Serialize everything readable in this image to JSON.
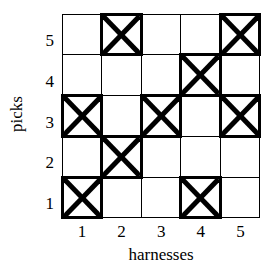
{
  "chart_data": {
    "type": "heatmap",
    "title": "",
    "xlabel": "harnesses",
    "ylabel": "picks",
    "x": [
      1,
      2,
      3,
      4,
      5
    ],
    "y": [
      1,
      2,
      3,
      4,
      5
    ],
    "xticklabels": [
      "1",
      "2",
      "3",
      "4",
      "5"
    ],
    "yticklabels": [
      "5",
      "4",
      "3",
      "2",
      "1"
    ],
    "grid": true,
    "legend": null,
    "marker": "x-box",
    "note": "Weave draft / threading grid. 1 = marked cell (filled with X and bold border), 0 = empty cell. Rows listed top to bottom: picks 5,4,3,2,1. Columns left to right: harnesses 1..5.",
    "rows": [
      {
        "pick": "5",
        "values": [
          0,
          1,
          0,
          0,
          1
        ]
      },
      {
        "pick": "4",
        "values": [
          0,
          0,
          0,
          1,
          0
        ]
      },
      {
        "pick": "3",
        "values": [
          1,
          0,
          1,
          0,
          1
        ]
      },
      {
        "pick": "2",
        "values": [
          0,
          1,
          0,
          0,
          0
        ]
      },
      {
        "pick": "1",
        "values": [
          1,
          0,
          0,
          1,
          0
        ]
      }
    ],
    "marked_cells": [
      {
        "harness": 2,
        "pick": 5
      },
      {
        "harness": 5,
        "pick": 5
      },
      {
        "harness": 4,
        "pick": 4
      },
      {
        "harness": 1,
        "pick": 3
      },
      {
        "harness": 3,
        "pick": 3
      },
      {
        "harness": 5,
        "pick": 3
      },
      {
        "harness": 2,
        "pick": 2
      },
      {
        "harness": 1,
        "pick": 1
      },
      {
        "harness": 4,
        "pick": 1
      }
    ],
    "colors": {
      "line": "#000000",
      "background": "#ffffff",
      "mark": "#000000"
    }
  }
}
